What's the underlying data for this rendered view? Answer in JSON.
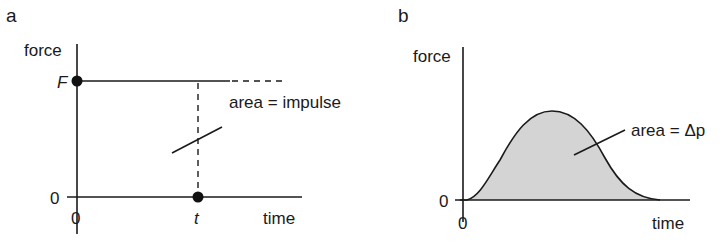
{
  "panels": [
    {
      "id": "a",
      "label": "a",
      "y_axis_label": "force",
      "x_axis_label": "time",
      "y_ticks": [
        "F",
        "0"
      ],
      "x_ticks": [
        "0",
        "t"
      ],
      "annotation": "area = impulse"
    },
    {
      "id": "b",
      "label": "b",
      "y_axis_label": "force",
      "x_axis_label": "time",
      "y_ticks": [
        "0"
      ],
      "x_ticks": [
        "0"
      ],
      "annotation": "area = Δp"
    }
  ],
  "colors": {
    "line": "#1a1a1a",
    "fill": "#d4d4d4"
  }
}
